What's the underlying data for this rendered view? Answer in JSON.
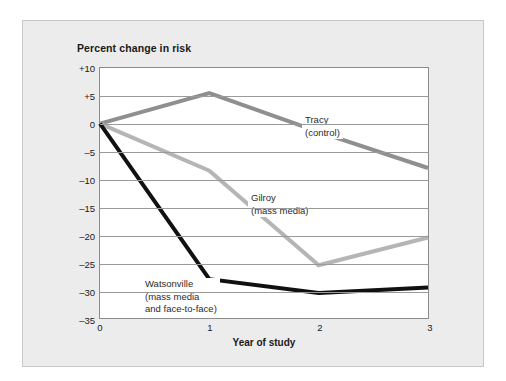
{
  "figure": {
    "title": "Percent change in risk",
    "xlabel": "Year of study",
    "background_color": "#ececec",
    "plot_background_color": "#ffffff"
  },
  "annotations": {
    "tracy": {
      "line1": "Tracy",
      "line2": "(control)"
    },
    "gilroy": {
      "line1": "Gilroy",
      "line2": "(mass media)"
    },
    "watsonville": {
      "line1": "Watsonville",
      "line2": "(mass media",
      "line3": "and face-to-face)"
    }
  },
  "axis": {
    "y_ticks": [
      "+10",
      "+5",
      "0",
      "–5",
      "–10",
      "–15",
      "–20",
      "–25",
      "–30",
      "–35"
    ],
    "x_ticks": [
      "0",
      "1",
      "2",
      "3"
    ]
  },
  "chart_data": {
    "type": "line",
    "title": "Percent change in risk",
    "xlabel": "Year of study",
    "ylabel": "Percent change in risk",
    "x": [
      0,
      1,
      2,
      3
    ],
    "xlim": [
      0,
      3
    ],
    "ylim": [
      -35,
      10
    ],
    "ytick_values": [
      10,
      5,
      0,
      -5,
      -10,
      -15,
      -20,
      -25,
      -30,
      -35
    ],
    "grid": true,
    "legend": "inline-annotations",
    "series": [
      {
        "name": "Tracy (control)",
        "color": "#8f8f8f",
        "values": [
          0,
          5.5,
          -1.5,
          -8
        ]
      },
      {
        "name": "Gilroy (mass media)",
        "color": "#b5b5b5",
        "values": [
          0,
          -8.5,
          -25.5,
          -20.5
        ]
      },
      {
        "name": "Watsonville (mass media and face-to-face)",
        "color": "#111111",
        "values": [
          0,
          -28,
          -30.5,
          -29.5
        ]
      }
    ]
  }
}
